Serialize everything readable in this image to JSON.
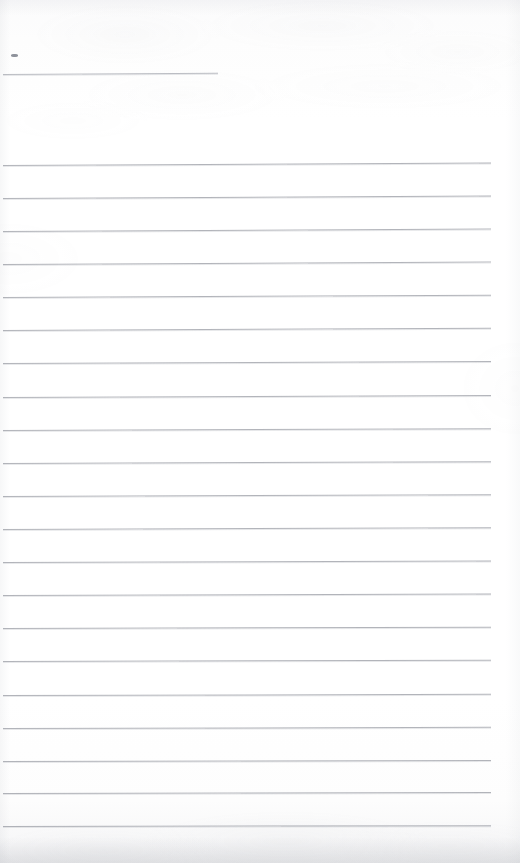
{
  "document": {
    "kind": "scanned-blank-lined-page",
    "title": "Blank ruled notebook page (scan)",
    "width_px": 520,
    "height_px": 863,
    "paper_color": "#fefefe",
    "rule_color": "#82868f",
    "has_visible_text": false,
    "text_content": "",
    "notes": "No handwriting, no printed words, no page number, no header or footer text are visible anywhere on the page."
  },
  "marks": {
    "speck": {
      "name": "ink-speck",
      "x": 11,
      "y": 54,
      "width": 7,
      "height": 3,
      "color": "#8e929b"
    }
  },
  "rules": {
    "short_rule": {
      "index": 0,
      "y": 74,
      "x_start": 3,
      "x_end": 218,
      "length": 215,
      "slant_deg": -0.35,
      "full_width": false
    },
    "full_rules": [
      {
        "index": 1,
        "y": 165,
        "x_start": 3,
        "x_end": 491,
        "slant_deg": -0.3
      },
      {
        "index": 2,
        "y": 198,
        "x_start": 3,
        "x_end": 491,
        "slant_deg": -0.3
      },
      {
        "index": 3,
        "y": 231,
        "x_start": 3,
        "x_end": 491,
        "slant_deg": -0.28
      },
      {
        "index": 4,
        "y": 264,
        "x_start": 3,
        "x_end": 491,
        "slant_deg": -0.28
      },
      {
        "index": 5,
        "y": 297,
        "x_start": 3,
        "x_end": 491,
        "slant_deg": -0.26
      },
      {
        "index": 6,
        "y": 330,
        "x_start": 3,
        "x_end": 491,
        "slant_deg": -0.26
      },
      {
        "index": 7,
        "y": 363,
        "x_start": 3,
        "x_end": 491,
        "slant_deg": -0.24
      },
      {
        "index": 8,
        "y": 397,
        "x_start": 3,
        "x_end": 491,
        "slant_deg": -0.24
      },
      {
        "index": 9,
        "y": 430,
        "x_start": 3,
        "x_end": 491,
        "slant_deg": -0.22
      },
      {
        "index": 10,
        "y": 463,
        "x_start": 3,
        "x_end": 491,
        "slant_deg": -0.22
      },
      {
        "index": 11,
        "y": 496,
        "x_start": 3,
        "x_end": 491,
        "slant_deg": -0.2
      },
      {
        "index": 12,
        "y": 529,
        "x_start": 3,
        "x_end": 491,
        "slant_deg": -0.2
      },
      {
        "index": 13,
        "y": 562,
        "x_start": 3,
        "x_end": 491,
        "slant_deg": -0.18
      },
      {
        "index": 14,
        "y": 595,
        "x_start": 3,
        "x_end": 491,
        "slant_deg": -0.18
      },
      {
        "index": 15,
        "y": 628,
        "x_start": 3,
        "x_end": 491,
        "slant_deg": -0.16
      },
      {
        "index": 16,
        "y": 661,
        "x_start": 3,
        "x_end": 491,
        "slant_deg": -0.16
      },
      {
        "index": 17,
        "y": 695,
        "x_start": 3,
        "x_end": 491,
        "slant_deg": -0.14
      },
      {
        "index": 18,
        "y": 728,
        "x_start": 3,
        "x_end": 491,
        "slant_deg": -0.14
      },
      {
        "index": 19,
        "y": 761,
        "x_start": 3,
        "x_end": 491,
        "slant_deg": -0.12
      },
      {
        "index": 20,
        "y": 793,
        "x_start": 3,
        "x_end": 491,
        "slant_deg": -0.12
      },
      {
        "index": 21,
        "y": 826,
        "x_start": 3,
        "x_end": 491,
        "slant_deg": -0.1
      }
    ],
    "line_spacing_px": 33,
    "total_full_rules": 21
  }
}
